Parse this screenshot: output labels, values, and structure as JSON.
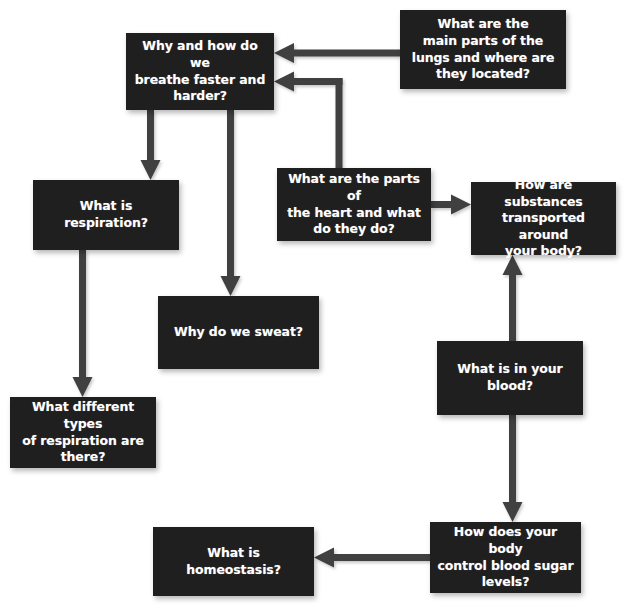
{
  "diagram": {
    "title": "",
    "type": "flowchart",
    "background_color": "#ffffff",
    "node_fill_color": "#201f1f",
    "node_text_color": "#ffffff",
    "arrow_color": "#3f3f3f",
    "nodes": [
      {
        "id": "lungs",
        "label": "What are the\nmain parts of the\nlungs and where are\nthey located?",
        "x": 400,
        "y": 10,
        "w": 166,
        "h": 79
      },
      {
        "id": "breathe",
        "label": "Why and how do we\nbreathe faster and\nharder?",
        "x": 126,
        "y": 33,
        "w": 148,
        "h": 77
      },
      {
        "id": "heart",
        "label": "What are the parts of\nthe heart and what\ndo they do?",
        "x": 277,
        "y": 168,
        "w": 154,
        "h": 73
      },
      {
        "id": "substances",
        "label": "How are substances\ntransported around\nyour body?",
        "x": 471,
        "y": 182,
        "w": 145,
        "h": 73
      },
      {
        "id": "respiration",
        "label": "What is respiration?",
        "x": 33,
        "y": 180,
        "w": 146,
        "h": 70
      },
      {
        "id": "sweat",
        "label": "Why do we sweat?",
        "x": 158,
        "y": 296,
        "w": 161,
        "h": 73
      },
      {
        "id": "blood",
        "label": "What is in your\nblood?",
        "x": 437,
        "y": 341,
        "w": 146,
        "h": 74
      },
      {
        "id": "types",
        "label": "What different types\nof respiration are\nthere?",
        "x": 10,
        "y": 397,
        "w": 146,
        "h": 71
      },
      {
        "id": "homeostasis",
        "label": "What is homeostasis?",
        "x": 153,
        "y": 527,
        "w": 161,
        "h": 69
      },
      {
        "id": "bloodsugar",
        "label": "How does your body\ncontrol blood sugar\nlevels?",
        "x": 430,
        "y": 522,
        "w": 151,
        "h": 71
      }
    ],
    "edges": [
      {
        "id": "lungs-to-breathe",
        "from": "lungs",
        "to": "breathe",
        "direction": "left"
      },
      {
        "id": "heart-to-breathe",
        "from": "heart",
        "to": "breathe",
        "direction": "up-left-elbow"
      },
      {
        "id": "heart-to-substances",
        "from": "heart",
        "to": "substances",
        "direction": "right"
      },
      {
        "id": "breathe-to-respiration",
        "from": "breathe",
        "to": "respiration",
        "direction": "down"
      },
      {
        "id": "breathe-to-sweat",
        "from": "breathe",
        "to": "sweat",
        "direction": "down"
      },
      {
        "id": "respiration-to-types",
        "from": "respiration",
        "to": "types",
        "direction": "down"
      },
      {
        "id": "blood-to-substances",
        "from": "blood",
        "to": "substances",
        "direction": "up"
      },
      {
        "id": "blood-to-bloodsugar",
        "from": "blood",
        "to": "bloodsugar",
        "direction": "down"
      },
      {
        "id": "bloodsugar-to-homeostasis",
        "from": "bloodsugar",
        "to": "homeostasis",
        "direction": "left"
      }
    ]
  }
}
